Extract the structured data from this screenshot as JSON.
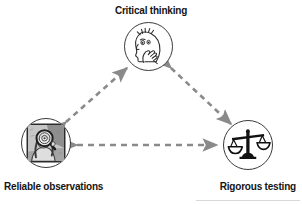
{
  "diagram": {
    "title_text": "",
    "type": "triangular-cycle",
    "background_color": "#ffffff",
    "nodes": [
      {
        "id": "critical-thinking",
        "label": "Critical thinking",
        "icon": "thinking-head-icon",
        "icon_description": "side profile of a head with hand on chin, thinking",
        "position": "top",
        "circle": {
          "cx": 148,
          "cy": 46,
          "r": 24
        },
        "outline_color": "#3a3a3a"
      },
      {
        "id": "reliable-observations",
        "label": "Reliable observations",
        "icon": "magnifying-glass-observer-icon",
        "icon_description": "grayscale photo of a person holding a magnifying glass inside a square frame",
        "position": "bottom-left",
        "circle": {
          "cx": 46,
          "cy": 143,
          "r": 25
        },
        "outline_color": "#3a3a3a"
      },
      {
        "id": "rigorous-testing",
        "label": "Rigorous testing",
        "icon": "balance-scale-icon",
        "icon_description": "two-pan balance scale",
        "position": "bottom-right",
        "circle": {
          "cx": 248,
          "cy": 145,
          "r": 25
        },
        "outline_color": "#3a3a3a"
      }
    ],
    "connectors": [
      {
        "id": "observations-to-thinking",
        "from": "reliable-observations",
        "to": "critical-thinking",
        "style": "dashed",
        "arrowheads": "both",
        "color": "#8a8a8a"
      },
      {
        "id": "thinking-to-testing",
        "from": "critical-thinking",
        "to": "rigorous-testing",
        "style": "dashed",
        "arrowheads": "both",
        "color": "#8a8a8a"
      },
      {
        "id": "observations-to-testing",
        "from": "reliable-observations",
        "to": "rigorous-testing",
        "style": "dashed",
        "arrowheads": "both",
        "color": "#8a8a8a"
      }
    ],
    "colors": {
      "label_text": "#141414",
      "connector": "#8a8a8a",
      "circle_outline": "#3a3a3a",
      "icon_ink": "#2b2b2b",
      "photo_mid_gray": "#9a9a9a"
    }
  }
}
